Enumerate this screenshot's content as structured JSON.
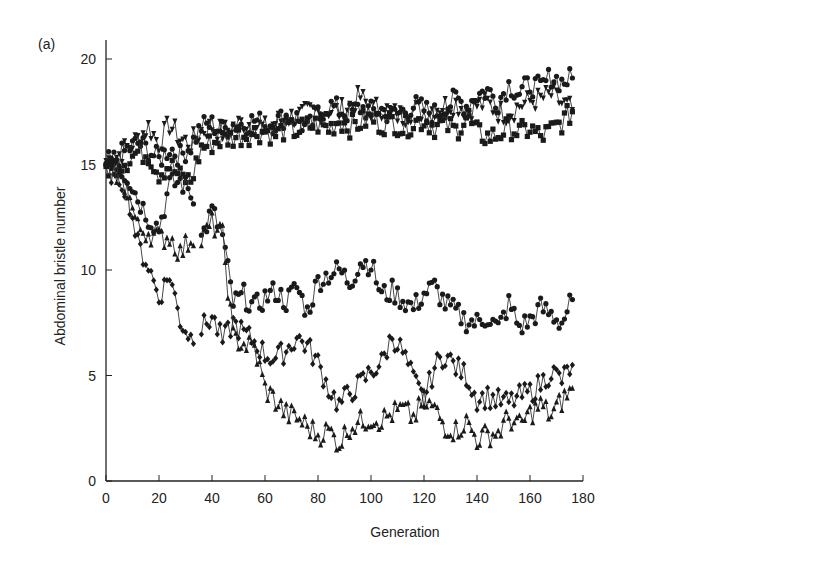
{
  "figure": {
    "panel_label": "(a)",
    "xlabel": "Generation",
    "ylabel": "Abdominal bristle number"
  },
  "chart_data": {
    "type": "line",
    "title": "",
    "panel_label": "(a)",
    "xlabel": "Generation",
    "ylabel": "Abdominal bristle number",
    "xlim": [
      0,
      180
    ],
    "ylim": [
      0,
      20
    ],
    "xticks": [
      0,
      20,
      40,
      60,
      80,
      100,
      120,
      140,
      160,
      180
    ],
    "yticks": [
      0,
      5,
      10,
      15,
      20
    ],
    "grid": false,
    "legend": null,
    "x": [
      0,
      4,
      8,
      12,
      16,
      20,
      24,
      28,
      32,
      36,
      40,
      44,
      48,
      52,
      56,
      60,
      64,
      68,
      72,
      76,
      80,
      84,
      88,
      92,
      96,
      100,
      104,
      108,
      112,
      116,
      120,
      124,
      128,
      132,
      136,
      140,
      144,
      148,
      152,
      156,
      160,
      164,
      168,
      172,
      176
    ],
    "series": [
      {
        "name": "Up line 1 (inverted triangles)",
        "marker": "triangle-down",
        "values": [
          15.2,
          15.4,
          15.8,
          16.2,
          16.8,
          16.0,
          16.9,
          16.2,
          16.0,
          16.6,
          16.8,
          16.5,
          16.8,
          17.0,
          16.9,
          16.7,
          17.0,
          17.2,
          17.3,
          17.4,
          17.5,
          17.6,
          17.5,
          17.8,
          18.2,
          17.6,
          17.7,
          17.4,
          17.3,
          17.6,
          17.5,
          17.7,
          17.8,
          17.9,
          17.6,
          17.8,
          17.9,
          17.5,
          17.4,
          17.8,
          18.0,
          18.1,
          18.3,
          17.9,
          17.6
        ]
      },
      {
        "name": "Up line 2 (circles)",
        "marker": "circle",
        "values": [
          15.0,
          15.3,
          15.7,
          16.0,
          15.7,
          15.2,
          15.8,
          15.4,
          15.9,
          16.8,
          16.9,
          16.6,
          16.9,
          16.9,
          17.1,
          16.9,
          17.0,
          17.3,
          17.2,
          16.6,
          17.4,
          17.8,
          17.6,
          17.4,
          17.7,
          17.5,
          17.6,
          17.3,
          17.5,
          17.8,
          17.6,
          17.4,
          17.7,
          18.1,
          17.8,
          18.3,
          18.5,
          18.0,
          18.8,
          18.4,
          18.8,
          18.6,
          19.2,
          18.9,
          19.1
        ]
      },
      {
        "name": "Up line 3 (squares)",
        "marker": "square",
        "values": [
          14.8,
          15.0,
          15.2,
          15.6,
          15.5,
          14.6,
          15.0,
          14.4,
          14.2,
          15.8,
          16.0,
          16.2,
          16.3,
          16.4,
          16.5,
          16.6,
          16.4,
          16.7,
          16.6,
          16.8,
          16.9,
          16.7,
          17.1,
          16.8,
          17.0,
          17.2,
          16.9,
          17.1,
          16.7,
          17.0,
          17.1,
          16.8,
          16.9,
          16.6,
          17.2,
          16.5,
          16.3,
          16.4,
          16.8,
          16.5,
          16.7,
          16.3,
          16.6,
          17.0,
          17.5
        ]
      },
      {
        "name": "Down line 1 (circles)",
        "marker": "circle",
        "values": [
          15.0,
          14.9,
          14.5,
          13.4,
          12.5,
          12.0,
          14.0,
          14.2,
          13.7,
          11.5,
          12.8,
          11.6,
          8.4,
          8.8,
          8.2,
          8.7,
          9.0,
          8.5,
          9.2,
          8.0,
          9.5,
          9.8,
          10.0,
          9.4,
          10.4,
          10.3,
          8.8,
          9.0,
          8.6,
          8.2,
          8.9,
          9.2,
          8.4,
          8.0,
          7.6,
          7.5,
          7.8,
          7.2,
          8.4,
          7.3,
          7.6,
          8.2,
          7.9,
          7.5,
          8.6
        ]
      },
      {
        "name": "Down line 2 (diamonds)",
        "marker": "diamond",
        "values": [
          14.7,
          14.6,
          13.8,
          11.2,
          10.2,
          8.7,
          9.8,
          7.6,
          6.8,
          7.2,
          7.8,
          6.6,
          7.5,
          7.0,
          6.6,
          6.0,
          5.8,
          6.2,
          6.8,
          6.4,
          5.6,
          4.4,
          3.6,
          4.2,
          4.6,
          5.2,
          5.6,
          6.9,
          6.1,
          4.8,
          3.8,
          5.4,
          6.0,
          5.4,
          5.0,
          3.9,
          4.0,
          3.8,
          3.7,
          4.0,
          4.2,
          4.6,
          5.2,
          4.8,
          5.5
        ]
      },
      {
        "name": "Down line 3 (triangles)",
        "marker": "triangle",
        "values": [
          14.8,
          14.6,
          13.8,
          12.0,
          11.8,
          11.5,
          11.6,
          10.8,
          11.5,
          11.4,
          12.2,
          11.6,
          6.8,
          6.5,
          6.3,
          4.4,
          3.8,
          3.2,
          3.0,
          2.6,
          2.2,
          2.4,
          1.8,
          2.6,
          2.8,
          3.0,
          2.9,
          3.2,
          3.4,
          3.0,
          3.8,
          3.4,
          2.6,
          2.4,
          2.8,
          2.0,
          2.2,
          2.3,
          3.0,
          2.6,
          3.2,
          3.6,
          3.1,
          3.8,
          4.4
        ]
      }
    ]
  }
}
